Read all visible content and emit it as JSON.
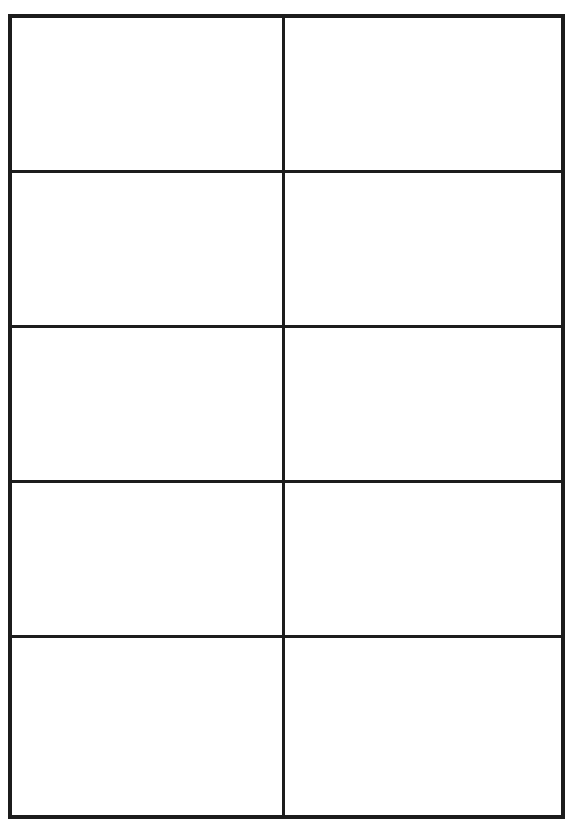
{
  "document": {
    "type": "blank-grid-template",
    "header_text": "",
    "grid": {
      "columns": 2,
      "rows": 5,
      "line_color": "#1c1c1c",
      "background_color": "#ffffff",
      "cells": [
        {
          "row": 1,
          "col": 1,
          "text": ""
        },
        {
          "row": 1,
          "col": 2,
          "text": ""
        },
        {
          "row": 2,
          "col": 1,
          "text": ""
        },
        {
          "row": 2,
          "col": 2,
          "text": ""
        },
        {
          "row": 3,
          "col": 1,
          "text": ""
        },
        {
          "row": 3,
          "col": 2,
          "text": ""
        },
        {
          "row": 4,
          "col": 1,
          "text": ""
        },
        {
          "row": 4,
          "col": 2,
          "text": ""
        },
        {
          "row": 5,
          "col": 1,
          "text": ""
        },
        {
          "row": 5,
          "col": 2,
          "text": ""
        }
      ]
    }
  }
}
